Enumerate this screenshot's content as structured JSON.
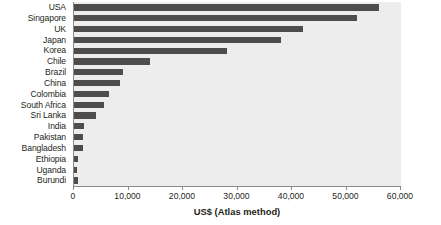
{
  "chart_data": {
    "type": "bar",
    "orientation": "horizontal",
    "title": "",
    "subtitle": "",
    "xlabel": "US$ (Atlas method)",
    "ylabel": "",
    "xlim": [
      0,
      60000
    ],
    "xticks": [
      0,
      10000,
      20000,
      30000,
      40000,
      50000,
      60000
    ],
    "xtick_labels": [
      "0",
      "10,000",
      "20,000",
      "30,000",
      "40,000",
      "50,000",
      "60,000"
    ],
    "grid": false,
    "legend": false,
    "legend_position": "none",
    "categories": [
      "USA",
      "Singapore",
      "UK",
      "Japan",
      "Korea",
      "Chile",
      "Brazil",
      "China",
      "Colombia",
      "South Africa",
      "Sri Lanka",
      "India",
      "Pakistan",
      "Bangladesh",
      "Ethiopia",
      "Uganda",
      "Burundi"
    ],
    "values": [
      56000,
      52000,
      42000,
      38000,
      28000,
      14000,
      9000,
      8500,
      6500,
      5500,
      4000,
      1800,
      1600,
      1600,
      700,
      600,
      800
    ],
    "series": [
      {
        "name": "GNI per capita",
        "values": [
          56000,
          52000,
          42000,
          38000,
          28000,
          14000,
          9000,
          8500,
          6500,
          5500,
          4000,
          1800,
          1600,
          1600,
          700,
          600,
          800
        ]
      }
    ],
    "colors": {
      "bar": "#4d4d4d",
      "plot_background": "#ededed",
      "axis": "#8a8a8a",
      "text": "#231f20",
      "page_background": "#ffffff"
    }
  }
}
